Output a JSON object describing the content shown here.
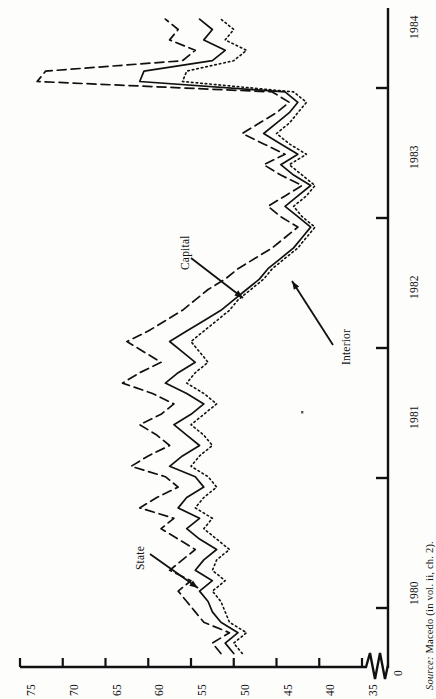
{
  "figure": {
    "orientation": "rotated-90",
    "source_note_prefix": "Source:",
    "source_note_text": " Macedo (in vol. ii, ch. 2)."
  },
  "axes": {
    "value_axis": {
      "label": "",
      "ticks": [
        "75",
        "70",
        "65",
        "60",
        "55",
        "50",
        "45",
        "40",
        "35"
      ],
      "break_label": "0",
      "range": [
        35,
        75
      ],
      "has_break": true
    },
    "time_axis": {
      "label": "",
      "ticks": [
        "1984",
        "1983",
        "1982",
        "1981",
        "1980"
      ],
      "range": [
        "1979.6",
        "1984.6"
      ]
    }
  },
  "annotations": [
    {
      "name": "capital",
      "text": "Capital"
    },
    {
      "name": "interior",
      "text": "Interior"
    },
    {
      "name": "state",
      "text": "State"
    }
  ],
  "colors": {
    "ink": "#111111",
    "paper": "#fdfdfc"
  },
  "chart_data": {
    "type": "line",
    "title": "",
    "subtitle": "",
    "xlabel": "",
    "ylabel": "",
    "orientation": "horizontal-value-axis",
    "grid": false,
    "legend": "annotated-arrows",
    "xlim": [
      1979.6,
      1984.6
    ],
    "ylim": [
      35,
      75
    ],
    "x_tick_labels": [
      "1980",
      "1981",
      "1982",
      "1983",
      "1984"
    ],
    "y_tick_labels": [
      "35",
      "40",
      "45",
      "50",
      "55",
      "60",
      "65",
      "70",
      "75"
    ],
    "axis_break_at": "0",
    "x": [
      1979.65,
      1979.73,
      1979.81,
      1979.89,
      1979.97,
      1980.05,
      1980.13,
      1980.21,
      1980.29,
      1980.37,
      1980.45,
      1980.53,
      1980.61,
      1980.69,
      1980.77,
      1980.85,
      1980.93,
      1981.01,
      1981.09,
      1981.17,
      1981.25,
      1981.33,
      1981.41,
      1981.49,
      1981.57,
      1981.65,
      1981.73,
      1981.81,
      1981.89,
      1981.97,
      1982.05,
      1982.13,
      1982.21,
      1982.29,
      1982.37,
      1982.45,
      1982.53,
      1982.61,
      1982.69,
      1982.77,
      1982.85,
      1982.93,
      1983.01,
      1983.09,
      1983.17,
      1983.25,
      1983.33,
      1983.41,
      1983.49,
      1983.57,
      1983.65,
      1983.73,
      1983.81,
      1983.89,
      1983.97,
      1984.05,
      1984.13,
      1984.21,
      1984.29,
      1984.37,
      1984.45,
      1984.53
    ],
    "series": [
      {
        "name": "Capital",
        "style": "dashed",
        "values": [
          51.5,
          52.5,
          50.5,
          53.5,
          54.5,
          55.5,
          56.5,
          55.0,
          57.5,
          56.0,
          54.5,
          56.5,
          58.5,
          57.0,
          61.0,
          59.0,
          56.5,
          58.0,
          62.0,
          60.0,
          57.5,
          59.0,
          61.0,
          58.5,
          57.0,
          59.5,
          63.0,
          61.0,
          58.5,
          60.5,
          62.5,
          60.0,
          58.0,
          56.0,
          54.5,
          53.0,
          51.0,
          49.5,
          47.5,
          45.5,
          44.0,
          42.5,
          44.5,
          46.0,
          44.0,
          42.0,
          44.5,
          46.5,
          44.0,
          46.5,
          49.0,
          47.0,
          45.0,
          43.5,
          45.5,
          73.0,
          72.0,
          56.0,
          54.5,
          57.5,
          56.5,
          58.0
        ]
      },
      {
        "name": "State",
        "style": "solid",
        "values": [
          50.0,
          51.0,
          49.5,
          51.5,
          52.5,
          53.0,
          54.0,
          52.5,
          54.5,
          53.5,
          52.0,
          54.0,
          55.5,
          54.0,
          56.5,
          55.5,
          53.5,
          54.5,
          57.5,
          56.0,
          54.0,
          55.5,
          57.0,
          55.0,
          53.5,
          55.5,
          58.0,
          56.5,
          54.5,
          56.0,
          57.5,
          55.5,
          53.5,
          51.5,
          50.0,
          48.5,
          47.0,
          46.0,
          44.5,
          43.0,
          42.0,
          41.0,
          42.5,
          44.0,
          42.5,
          41.0,
          43.0,
          44.5,
          42.5,
          44.5,
          46.5,
          45.0,
          43.5,
          42.5,
          44.0,
          61.0,
          60.5,
          52.5,
          51.0,
          53.5,
          52.5,
          54.0
        ]
      },
      {
        "name": "Interior",
        "style": "dotted",
        "values": [
          49.0,
          50.0,
          48.5,
          50.5,
          51.0,
          51.5,
          52.5,
          51.0,
          52.5,
          52.0,
          50.5,
          52.0,
          53.5,
          52.5,
          54.5,
          53.5,
          52.0,
          53.0,
          55.0,
          54.0,
          52.5,
          53.5,
          55.0,
          53.5,
          52.0,
          53.5,
          55.5,
          54.5,
          53.0,
          54.0,
          55.0,
          53.5,
          52.0,
          50.5,
          49.5,
          48.0,
          46.5,
          45.5,
          44.0,
          42.5,
          41.5,
          40.5,
          42.0,
          43.0,
          41.5,
          40.5,
          42.0,
          43.5,
          41.5,
          43.5,
          45.0,
          43.5,
          42.5,
          41.5,
          43.0,
          56.0,
          55.5,
          50.0,
          48.5,
          51.0,
          50.0,
          51.5
        ]
      }
    ]
  }
}
